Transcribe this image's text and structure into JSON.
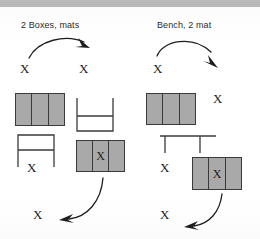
{
  "page": {
    "background_color": "#ffffff",
    "ink_color": "#1d1d1d",
    "band_color": "#b9b9b9",
    "box_fill_color": "#a9a9a9",
    "box_stroke_color": "#3a3a3a"
  },
  "panels": [
    {
      "id": "left",
      "title": "2 Boxes, mats",
      "markers": [
        {
          "id": "left-x-start",
          "label": "X"
        },
        {
          "id": "left-x-second",
          "label": "X"
        },
        {
          "id": "left-x-under-bench",
          "label": "X"
        },
        {
          "id": "left-x-in-box",
          "label": "X"
        },
        {
          "id": "left-x-finish",
          "label": "X"
        }
      ],
      "equipment": [
        {
          "id": "left-box-top",
          "type": "segmented-box",
          "cells": 3,
          "marked_cell": null
        },
        {
          "id": "left-bench-up",
          "type": "bench-inverted"
        },
        {
          "id": "left-bench-down",
          "type": "bench"
        },
        {
          "id": "left-box-lower",
          "type": "segmented-box",
          "cells": 3,
          "marked_cell": 2
        }
      ],
      "arrows": [
        {
          "id": "left-arrow-top",
          "direction": "right"
        },
        {
          "id": "left-arrow-bottom",
          "direction": "left"
        }
      ]
    },
    {
      "id": "right",
      "title": "Bench, 2 mat",
      "markers": [
        {
          "id": "right-x-start",
          "label": "X"
        },
        {
          "id": "right-x-second",
          "label": "X"
        },
        {
          "id": "right-x-under-bench",
          "label": "X"
        },
        {
          "id": "right-x-in-box",
          "label": "X"
        },
        {
          "id": "right-x-finish",
          "label": "X"
        }
      ],
      "equipment": [
        {
          "id": "right-box-top",
          "type": "segmented-box",
          "cells": 3,
          "marked_cell": null
        },
        {
          "id": "right-bench",
          "type": "bench-wide"
        },
        {
          "id": "right-box-lower",
          "type": "segmented-box",
          "cells": 3,
          "marked_cell": 2
        }
      ],
      "arrows": [
        {
          "id": "right-arrow-top",
          "direction": "right-down"
        },
        {
          "id": "right-arrow-bottom",
          "direction": "left"
        }
      ]
    }
  ]
}
